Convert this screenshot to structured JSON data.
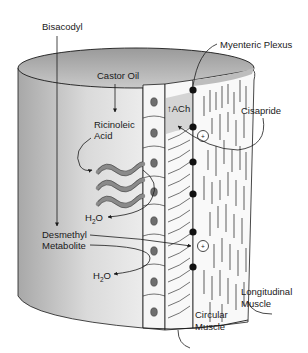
{
  "diagram": {
    "labels": {
      "bisacodyl": "Bisacodyl",
      "castor_oil": "Castor Oil",
      "ricinoleic_acid_line1": "Ricinoleic",
      "ricinoleic_acid_line2": "Acid",
      "water_1": "H",
      "water_1_sub": "2",
      "water_1_tail": "O",
      "desmethyl_line1": "Desmethyl",
      "desmethyl_line2": "Metabolite",
      "water_2": "H",
      "water_2_sub": "2",
      "water_2_tail": "O",
      "myenteric_plexus": "Myenteric Plexus",
      "ach": "↑ACh",
      "cisapride": "Cisapride",
      "longitudinal_line1": "Longitudinal",
      "longitudinal_line2": "Muscle",
      "circular_line1": "Circular",
      "circular_line2": "Muscle",
      "plus_symbol": "+"
    },
    "layers": [
      "Lumen",
      "Epithelium",
      "Circular Muscle",
      "Myenteric Plexus",
      "Longitudinal Muscle"
    ],
    "colors": {
      "background": "#ffffff",
      "lumen_dark": "#a9a9a9",
      "lumen_light": "#e6e6e6",
      "wall_light": "#f2f2f2",
      "ach_region": "#d4d4d4",
      "nucleus": "#6e6e6e",
      "lipid_chain": "#8a8a8a",
      "line": "#1a1a1a"
    }
  }
}
